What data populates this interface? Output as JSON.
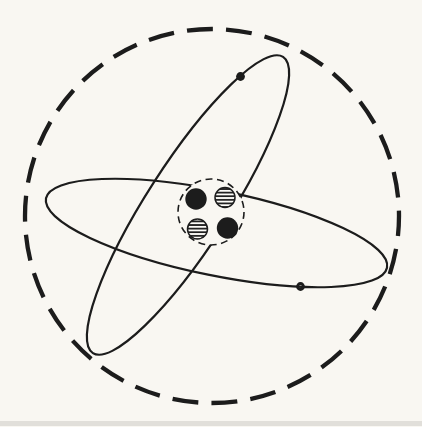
{
  "diagram": {
    "kind": "atom-model-figure",
    "colors": {
      "paper": "#f9f7f2",
      "ink": "#1c1c1c",
      "hatch_background": "#fdfcf8"
    },
    "atom_boundary": {
      "shape": "circle",
      "stroke_style": "dashed",
      "cx": 212,
      "cy": 216,
      "r": 187
    },
    "orbits": [
      {
        "name": "orbit-tilted",
        "cx": 188,
        "cy": 205,
        "rx": 176,
        "ry": 41,
        "rotation": -57.3
      },
      {
        "name": "orbit-horizontal",
        "cx": 216.5,
        "cy": 233,
        "rx": 174,
        "ry": 42.5,
        "rotation": 11.5
      }
    ],
    "electrons": [
      {
        "name": "electron-on-tilted-orbit",
        "style": "solid-dot",
        "cx": 240.5,
        "cy": 76.5,
        "r": 4.4
      },
      {
        "name": "electron-on-horizontal-orbit",
        "style": "open-dot",
        "cx": 300.5,
        "cy": 286.5,
        "r": 3
      }
    ],
    "nucleus": {
      "boundary": {
        "shape": "circle",
        "stroke_style": "dashed",
        "cx": 211,
        "cy": 212,
        "r": 33
      },
      "particles": [
        {
          "name": "nucleon-solid-upper-left",
          "style": "solid",
          "cx": 196,
          "cy": 199,
          "r": 10.7
        },
        {
          "name": "nucleon-hatched-upper-right",
          "style": "hatched",
          "cx": 225,
          "cy": 197.5,
          "r": 10
        },
        {
          "name": "nucleon-hatched-lower-left",
          "style": "hatched",
          "cx": 197.5,
          "cy": 229,
          "r": 10
        },
        {
          "name": "nucleon-solid-lower-right",
          "style": "solid",
          "cx": 227.5,
          "cy": 228,
          "r": 10.7
        }
      ]
    },
    "artifacts": {
      "bottom_scan_band": {
        "y": 421,
        "height": 5
      }
    }
  }
}
